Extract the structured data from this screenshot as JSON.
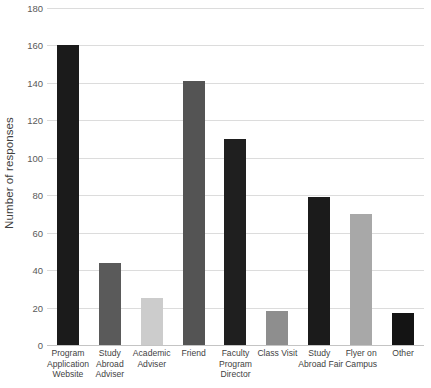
{
  "chart_data": {
    "type": "bar",
    "title": "",
    "xlabel": "",
    "ylabel": "Number of responses",
    "ylim": [
      0,
      180
    ],
    "ytick_step": 20,
    "yticks": [
      "0",
      "20",
      "40",
      "60",
      "80",
      "100",
      "120",
      "140",
      "160",
      "180"
    ],
    "grid": true,
    "legend": "none",
    "categories": [
      "Program Application Website",
      "Study Abroad Adviser",
      "Academic Adviser",
      "Friend",
      "Faculty Program Director",
      "Class Visit",
      "Study Abroad Fair",
      "Flyer on Campus",
      "Other"
    ],
    "category_lines": [
      [
        "Program",
        "Application",
        "Website"
      ],
      [
        "Study",
        "Abroad",
        "Adviser"
      ],
      [
        "Academic",
        "Adviser"
      ],
      [
        "Friend"
      ],
      [
        "Faculty",
        "Program",
        "Director"
      ],
      [
        "Class Visit"
      ],
      [
        "Study",
        "Abroad Fair"
      ],
      [
        "Flyer on",
        "Campus"
      ],
      [
        "Other"
      ]
    ],
    "values": [
      160,
      44,
      25,
      141,
      110,
      18,
      79,
      70,
      17
    ],
    "bar_colors": [
      "#1b1b1b",
      "#5a5a5a",
      "#cccccc",
      "#545454",
      "#1f1f1f",
      "#8e8e8e",
      "#1b1b1b",
      "#a8a8a8",
      "#141414"
    ]
  },
  "axis": {
    "gridline_color": "#dcdcdc",
    "baseline_color": "#c4c4c4",
    "tick_text_color": "#5a5a5a",
    "label_text_color": "#3f3f3f"
  }
}
